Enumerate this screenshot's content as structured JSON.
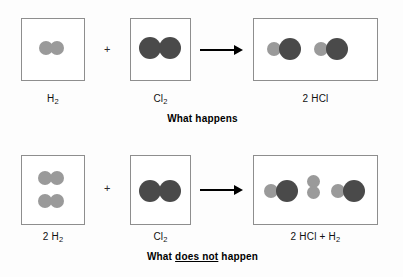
{
  "figure": {
    "type": "chemistry-reaction-diagram",
    "colors": {
      "hydrogen_atom": "#9a9a9a",
      "chlorine_atom": "#4a4a4a",
      "box_border": "#8e8e8e",
      "arrow": "#000000",
      "background": "#fdfdfd"
    }
  },
  "rows": [
    {
      "id": "what-happens",
      "caption": "What happens",
      "caption_underlined": "",
      "operators": {
        "plus": "+",
        "arrow": "arrow-right"
      },
      "panels": [
        {
          "role": "reactant",
          "label_text": "H2",
          "label_main": "H",
          "label_sub": "2",
          "molecules": [
            {
              "name": "hydrogen",
              "atoms": [
                "H",
                "H"
              ],
              "orientation": "horizontal"
            }
          ]
        },
        {
          "role": "reactant",
          "label_text": "Cl2",
          "label_main": "Cl",
          "label_sub": "2",
          "molecules": [
            {
              "name": "chlorine",
              "atoms": [
                "Cl",
                "Cl"
              ],
              "orientation": "horizontal"
            }
          ]
        },
        {
          "role": "product",
          "label_text": "2 HCl",
          "label_main": "2 HCl",
          "label_sub": "",
          "molecules": [
            {
              "name": "hydrogen-chloride",
              "atoms": [
                "H",
                "Cl"
              ],
              "orientation": "horizontal"
            },
            {
              "name": "hydrogen-chloride",
              "atoms": [
                "H",
                "Cl"
              ],
              "orientation": "horizontal"
            }
          ]
        }
      ]
    },
    {
      "id": "what-does-not-happen",
      "caption": "What does not happen",
      "caption_prefix": "What ",
      "caption_underlined": "does not",
      "caption_suffix": " happen",
      "operators": {
        "plus": "+",
        "arrow": "arrow-right"
      },
      "panels": [
        {
          "role": "reactant",
          "label_text": "2 H2",
          "label_main": "2 H",
          "label_sub": "2",
          "molecules": [
            {
              "name": "hydrogen",
              "atoms": [
                "H",
                "H"
              ],
              "orientation": "horizontal"
            },
            {
              "name": "hydrogen",
              "atoms": [
                "H",
                "H"
              ],
              "orientation": "horizontal"
            }
          ]
        },
        {
          "role": "reactant",
          "label_text": "Cl2",
          "label_main": "Cl",
          "label_sub": "2",
          "molecules": [
            {
              "name": "chlorine",
              "atoms": [
                "Cl",
                "Cl"
              ],
              "orientation": "horizontal"
            }
          ]
        },
        {
          "role": "product",
          "label_text": "2 HCl + H2",
          "label_main": "2 HCl + H",
          "label_sub": "2",
          "molecules": [
            {
              "name": "hydrogen-chloride",
              "atoms": [
                "H",
                "Cl"
              ],
              "orientation": "horizontal"
            },
            {
              "name": "hydrogen",
              "atoms": [
                "H",
                "H"
              ],
              "orientation": "vertical"
            },
            {
              "name": "hydrogen-chloride",
              "atoms": [
                "H",
                "Cl"
              ],
              "orientation": "horizontal"
            }
          ]
        }
      ]
    }
  ]
}
